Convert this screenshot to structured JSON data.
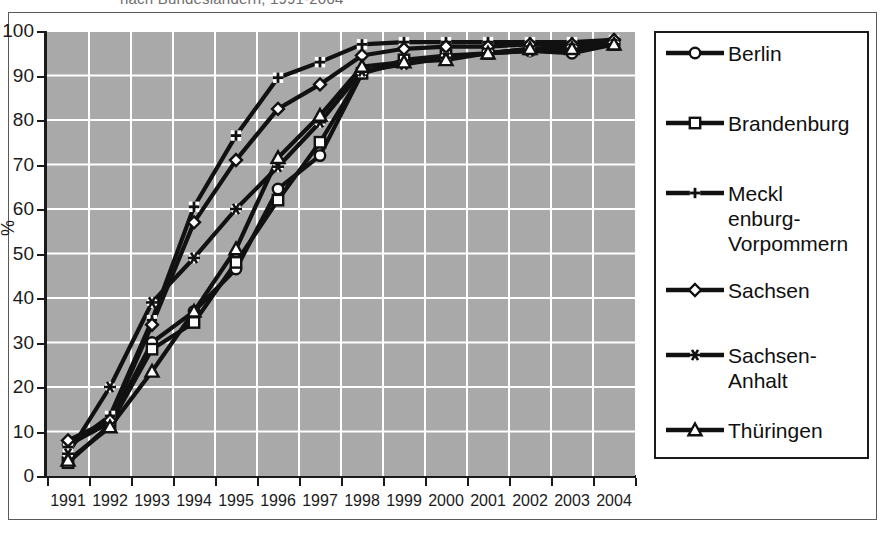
{
  "figure": {
    "title_clipped": "nach Bundesländern, 1991-2004",
    "axis_title_y": "%"
  },
  "chart_data": {
    "type": "line",
    "title": "nach Bundesländern, 1991-2004",
    "xlabel": "",
    "ylabel": "%",
    "ylim": [
      0,
      100
    ],
    "ytick_step": 10,
    "grid": true,
    "legend_position": "right",
    "background_color": "#a9a9a9",
    "gridline_color": "#ffffff",
    "line_color": "#111111",
    "categories": [
      "1991",
      "1992",
      "1993",
      "1994",
      "1995",
      "1996",
      "1997",
      "1998",
      "1999",
      "2000",
      "2001",
      "2002",
      "2003",
      "2004"
    ],
    "yticks": [
      "0",
      "10",
      "20",
      "30",
      "40",
      "50",
      "60",
      "70",
      "80",
      "90",
      "100"
    ],
    "series": [
      {
        "name": "Berlin",
        "marker": "circle",
        "values": [
          7,
          12,
          30,
          37,
          46.5,
          64.5,
          72,
          90.5,
          93,
          94,
          95,
          95.5,
          95,
          97
        ]
      },
      {
        "name": "Brandenburg",
        "marker": "square",
        "values": [
          3,
          11.5,
          28.5,
          34.5,
          48,
          62,
          75,
          90.5,
          93.5,
          94.5,
          95,
          96,
          96.5,
          97
        ]
      },
      {
        "name": "Mecklenburg-Vorpommern",
        "marker": "plus",
        "values": [
          6.5,
          13.5,
          35,
          60.5,
          76.5,
          89.5,
          93,
          97,
          97.5,
          97.5,
          97.5,
          97.5,
          97.5,
          98
        ]
      },
      {
        "name": "Sachsen",
        "marker": "diamond",
        "values": [
          8,
          12.5,
          34,
          57,
          71,
          82.5,
          88,
          94.5,
          96,
          96.5,
          96.5,
          97,
          97,
          98
        ]
      },
      {
        "name": "Sachsen-Anhalt",
        "marker": "asterisk",
        "values": [
          5,
          20,
          39,
          49,
          60,
          69.5,
          79.5,
          91,
          92.5,
          94,
          95,
          95.5,
          96,
          97
        ]
      },
      {
        "name": "Thüringen",
        "marker": "triangle",
        "values": [
          3.5,
          11,
          23.5,
          37,
          51,
          71.5,
          81,
          92,
          93,
          93.5,
          95,
          96,
          96,
          97
        ]
      }
    ]
  },
  "legend": {
    "items": [
      {
        "label": "Berlin",
        "marker": "circle"
      },
      {
        "label": "Brandenburg",
        "marker": "square"
      },
      {
        "label": "Meckl enburg- Vorpommern",
        "marker": "plus"
      },
      {
        "label": "Sachsen",
        "marker": "diamond"
      },
      {
        "label": "Sachsen- Anhalt",
        "marker": "asterisk"
      },
      {
        "label": "Thüringen",
        "marker": "triangle"
      }
    ]
  }
}
